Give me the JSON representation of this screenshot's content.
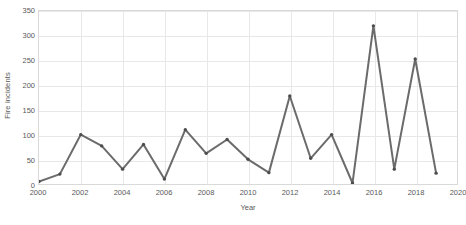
{
  "chart_data": {
    "type": "line",
    "title": "",
    "xlabel": "Year",
    "ylabel": "Fire incidents",
    "x": [
      2000,
      2001,
      2002,
      2003,
      2004,
      2005,
      2006,
      2007,
      2008,
      2009,
      2010,
      2011,
      2012,
      2013,
      2014,
      2015,
      2016,
      2017,
      2018,
      2019
    ],
    "values": [
      5,
      20,
      100,
      77,
      30,
      80,
      10,
      110,
      62,
      90,
      50,
      23,
      178,
      52,
      100,
      2,
      320,
      30,
      253,
      22
    ],
    "series": [
      {
        "name": "Fire incidents",
        "values": [
          5,
          20,
          100,
          77,
          30,
          80,
          10,
          110,
          62,
          90,
          50,
          23,
          178,
          52,
          100,
          2,
          320,
          30,
          253,
          22
        ]
      }
    ],
    "xlim": [
      2000,
      2020
    ],
    "ylim": [
      0,
      350
    ],
    "y_ticks": [
      0,
      50,
      100,
      150,
      200,
      250,
      300,
      350
    ],
    "y_tick_labels": [
      "0",
      "50",
      "100",
      "150",
      "200",
      "250",
      "300",
      "350"
    ],
    "x_ticks": [
      2000,
      2002,
      2004,
      2006,
      2008,
      2010,
      2012,
      2014,
      2016,
      2018,
      2020
    ],
    "x_tick_labels": [
      "2000",
      "2002",
      "2004",
      "2006",
      "2008",
      "2010",
      "2012",
      "2014",
      "2016",
      "2018",
      "2020"
    ],
    "grid": true,
    "grid_horizontal": true,
    "grid_vertical": true,
    "legend": false,
    "legend_position": "none",
    "marker": "circle",
    "colors": {
      "line": "#6b6b6b",
      "marker": "#4d4d4d",
      "grid": "#e8e8e8",
      "plot_border": "#d9d9d9",
      "text": "#595959",
      "background": "#ffffff"
    }
  }
}
